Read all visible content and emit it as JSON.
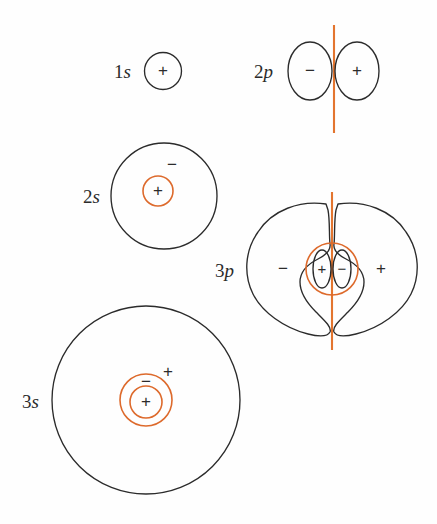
{
  "figure": {
    "background_color": "#fefefe",
    "contour_color": "#2b2b2b",
    "node_color": "#e3752f"
  },
  "orbitals": [
    {
      "id": "1s",
      "label_number": "1",
      "label_letter": "s",
      "type": "s",
      "shells": 1,
      "radial_nodes": 0,
      "angular_nodes": 0,
      "signs": [
        "+"
      ],
      "regions": [
        {
          "name": "core",
          "sign": "+",
          "boundary": "black"
        }
      ]
    },
    {
      "id": "2s",
      "label_number": "2",
      "label_letter": "s",
      "type": "s",
      "shells": 2,
      "radial_nodes": 1,
      "angular_nodes": 0,
      "signs": [
        "+",
        "-"
      ],
      "regions": [
        {
          "name": "core",
          "sign": "+",
          "boundary": "orange"
        },
        {
          "name": "outer",
          "sign": "-",
          "boundary": "black"
        }
      ]
    },
    {
      "id": "3s",
      "label_number": "3",
      "label_letter": "s",
      "type": "s",
      "shells": 3,
      "radial_nodes": 2,
      "angular_nodes": 0,
      "signs": [
        "+",
        "-",
        "+"
      ],
      "regions": [
        {
          "name": "core",
          "sign": "+",
          "boundary": "orange"
        },
        {
          "name": "middle",
          "sign": "-",
          "boundary": "orange"
        },
        {
          "name": "outer",
          "sign": "+",
          "boundary": "black"
        }
      ]
    },
    {
      "id": "2p",
      "label_number": "2",
      "label_letter": "p",
      "type": "p",
      "shells": 1,
      "radial_nodes": 0,
      "angular_nodes": 1,
      "signs": [
        "-",
        "+"
      ],
      "regions": [
        {
          "name": "left-lobe",
          "sign": "-",
          "boundary": "black"
        },
        {
          "name": "right-lobe",
          "sign": "+",
          "boundary": "black"
        }
      ]
    },
    {
      "id": "3p",
      "label_number": "3",
      "label_letter": "p",
      "type": "p",
      "shells": 2,
      "radial_nodes": 1,
      "angular_nodes": 1,
      "signs": [
        "-",
        "+",
        "-",
        "+"
      ],
      "regions": [
        {
          "name": "outer-left-lobe",
          "sign": "-",
          "boundary": "black"
        },
        {
          "name": "inner-left-lobe",
          "sign": "+",
          "boundary": "black"
        },
        {
          "name": "inner-right-lobe",
          "sign": "-",
          "boundary": "black"
        },
        {
          "name": "outer-right-lobe",
          "sign": "+",
          "boundary": "black"
        }
      ]
    }
  ],
  "labels": {
    "one_s": "1s",
    "two_s": "2s",
    "three_s": "3s",
    "two_p": "2p",
    "three_p": "3p",
    "plus": "+",
    "minus": "−"
  },
  "signs": {
    "s1_core": "+",
    "s2_core": "+",
    "s2_outer": "−",
    "s3_core": "+",
    "s3_middle": "−",
    "s3_outer": "+",
    "p2_left": "−",
    "p2_right": "+",
    "p3_outer_left": "−",
    "p3_inner_left": "+",
    "p3_inner_right": "−",
    "p3_outer_right": "+"
  }
}
